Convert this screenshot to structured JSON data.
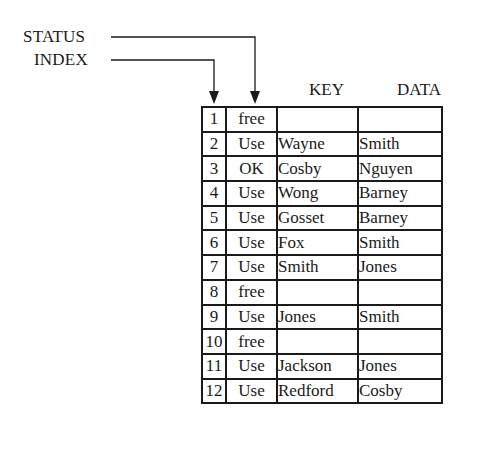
{
  "labels": {
    "status": "STATUS",
    "index": "INDEX"
  },
  "columns": {
    "key": "KEY",
    "data": "DATA"
  },
  "rows": [
    {
      "index": "1",
      "status": "free",
      "key": "",
      "data": ""
    },
    {
      "index": "2",
      "status": "Use",
      "key": "Wayne",
      "data": "Smith"
    },
    {
      "index": "3",
      "status": "OK",
      "key": "Cosby",
      "data": "Nguyen"
    },
    {
      "index": "4",
      "status": "Use",
      "key": "Wong",
      "data": "Barney"
    },
    {
      "index": "5",
      "status": "Use",
      "key": "Gosset",
      "data": "Barney"
    },
    {
      "index": "6",
      "status": "Use",
      "key": "Fox",
      "data": "Smith"
    },
    {
      "index": "7",
      "status": "Use",
      "key": "Smith",
      "data": "Jones"
    },
    {
      "index": "8",
      "status": "free",
      "key": "",
      "data": ""
    },
    {
      "index": "9",
      "status": "Use",
      "key": "Jones",
      "data": "Smith"
    },
    {
      "index": "10",
      "status": "free",
      "key": "",
      "data": ""
    },
    {
      "index": "11",
      "status": "Use",
      "key": "Jackson",
      "data": "Jones"
    },
    {
      "index": "12",
      "status": "Use",
      "key": "Redford",
      "data": "Cosby"
    }
  ],
  "colors": {
    "ink": "#1a1a1a",
    "background": "#ffffff"
  }
}
